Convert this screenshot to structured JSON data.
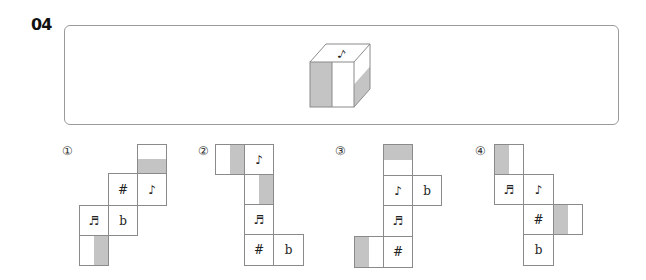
{
  "question": {
    "number": "04"
  },
  "cube": {
    "top_symbol": "♪",
    "front_face": "left half shaded",
    "right_face": "lower half shaded",
    "shade_color": "#c4c4c4",
    "line_color": "#8a8a8a"
  },
  "options": [
    {
      "marker": "①",
      "cells": [
        {
          "symbol": "",
          "shade": "bottom-half"
        },
        {
          "symbol": "#"
        },
        {
          "symbol": "♪"
        },
        {
          "symbol": "♬"
        },
        {
          "symbol": "b"
        },
        {
          "symbol": "",
          "shade": "right-half"
        }
      ]
    },
    {
      "marker": "②",
      "cells": [
        {
          "symbol": "",
          "shade": "right-half"
        },
        {
          "symbol": "♪"
        },
        {
          "symbol": "",
          "shade": "right-half"
        },
        {
          "symbol": "♬"
        },
        {
          "symbol": "#"
        },
        {
          "symbol": "b"
        }
      ]
    },
    {
      "marker": "③",
      "cells": [
        {
          "symbol": "",
          "shade": "top-half"
        },
        {
          "symbol": "♪"
        },
        {
          "symbol": "b"
        },
        {
          "symbol": "♬"
        },
        {
          "symbol": "",
          "shade": "left-half"
        },
        {
          "symbol": "#"
        }
      ]
    },
    {
      "marker": "④",
      "cells": [
        {
          "symbol": "",
          "shade": "left-half"
        },
        {
          "symbol": "♬"
        },
        {
          "symbol": "♪"
        },
        {
          "symbol": "#"
        },
        {
          "symbol": "",
          "shade": "left-half"
        },
        {
          "symbol": "b"
        }
      ]
    }
  ]
}
